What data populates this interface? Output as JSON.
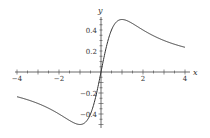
{
  "chart_data": {
    "type": "line",
    "title": "",
    "xlabel": "x",
    "ylabel": "y",
    "xlim": [
      -4,
      4
    ],
    "ylim": [
      -0.5,
      0.5
    ],
    "grid": false,
    "x_ticks": [
      -4,
      -2,
      2,
      4
    ],
    "x_tick_labels": [
      "-4",
      "-2",
      "2",
      "4"
    ],
    "y_ticks": [
      0.4,
      0.2,
      -0.2,
      -0.4
    ],
    "y_tick_labels": [
      "0.4",
      "0.2",
      "-0.2",
      "-0.4"
    ],
    "series": [
      {
        "name": "y = x/(1+x^2)",
        "x": [
          -4,
          -3,
          -2,
          -1.5,
          -1,
          -0.5,
          0,
          0.5,
          1,
          1.5,
          2,
          3,
          4
        ],
        "values": [
          -0.235,
          -0.3,
          -0.4,
          -0.462,
          -0.5,
          -0.4,
          0,
          0.4,
          0.5,
          0.462,
          0.4,
          0.3,
          0.235
        ]
      }
    ]
  }
}
